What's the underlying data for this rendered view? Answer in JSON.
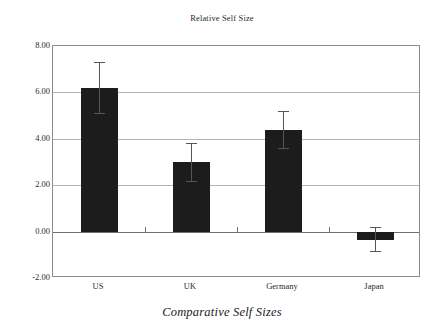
{
  "chart_data": {
    "type": "bar",
    "title": "Relative Self Size",
    "caption": "Comparative Self Sizes",
    "xlabel": "",
    "ylabel": "",
    "categories": [
      "US",
      "UK",
      "Germany",
      "Japan"
    ],
    "values": [
      6.2,
      3.0,
      4.4,
      -0.35
    ],
    "error_upper": [
      7.3,
      3.8,
      5.2,
      0.2
    ],
    "error_lower": [
      5.1,
      2.2,
      3.6,
      -0.85
    ],
    "ylim": [
      -2.0,
      8.0
    ],
    "ytick_labels": [
      "8.00",
      "6.00",
      "4.00",
      "2.00",
      "0.00",
      "-2.00"
    ],
    "ytick_values": [
      8.0,
      6.0,
      4.0,
      2.0,
      0.0,
      -2.0
    ],
    "grid": true,
    "legend": false,
    "bar_color": "#1c1c1c",
    "grid_color": "#b4b4b4",
    "axis_color": "#8c8c8c",
    "error_color": "#555555",
    "background": "#ffffff"
  }
}
